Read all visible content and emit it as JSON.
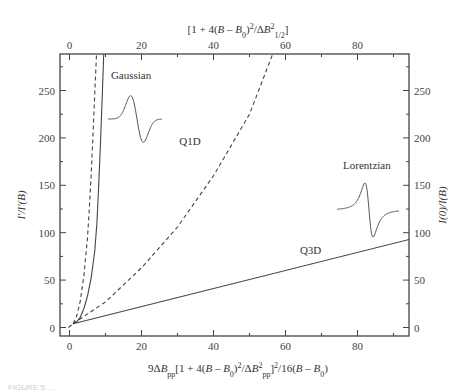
{
  "chart_data": {
    "type": "line",
    "title": "",
    "xlabel": "9ΔB_pp[1 + 4(B – B_0)^2/ΔB_pp^2]^2/16(B – B_0)",
    "x2label": "[1 + 4(B – B_0)^2/ΔB_1/2^2]",
    "ylabel": "I'/I'(B)",
    "y2label": "I(0)/I(B)",
    "xlim": [
      -0.3,
      94.5
    ],
    "ylim": [
      -7,
      288
    ],
    "x_ticks": [
      0,
      20,
      40,
      60,
      80
    ],
    "x_minor": [
      10,
      30,
      50,
      70,
      90
    ],
    "x2_ticks": [
      0,
      20,
      40,
      60,
      80
    ],
    "y_ticks": [
      0,
      50,
      100,
      150,
      200,
      250
    ],
    "y_minor": [
      25,
      75,
      125,
      175,
      225,
      275
    ],
    "grid": false,
    "series": [
      {
        "name": "Gaussian (solid)",
        "style": "solid",
        "x": [
          1,
          2,
          3,
          4,
          5,
          6,
          7,
          7.6,
          8.1,
          8.6,
          9.1,
          9.5
        ],
        "y": [
          4,
          6,
          11,
          20,
          33,
          52,
          80,
          110,
          150,
          195,
          245,
          288
        ]
      },
      {
        "name": "Gaussian (dashed)",
        "style": "dashed",
        "x": [
          1,
          2,
          3,
          4,
          5,
          5.5,
          6,
          6.5,
          7,
          7.5
        ],
        "y": [
          4,
          12,
          28,
          55,
          95,
          125,
          160,
          200,
          245,
          288
        ]
      },
      {
        "name": "Q1D",
        "style": "dashed",
        "x": [
          1,
          10,
          20,
          30,
          40,
          50,
          56.4
        ],
        "y": [
          4,
          27,
          63,
          106,
          160,
          225,
          288
        ]
      },
      {
        "name": "Q3D",
        "style": "solid",
        "x": [
          1,
          94.5
        ],
        "y": [
          4,
          93
        ]
      },
      {
        "name": "low-x dashed lead-in",
        "style": "dashed",
        "x": [
          -0.3,
          1
        ],
        "y": [
          0,
          4
        ]
      }
    ],
    "annotations": [
      {
        "text": "Gaussian",
        "x": 11.5,
        "y": 262
      },
      {
        "text": "Q1D",
        "x": 30.5,
        "y": 192
      },
      {
        "text": "Lorentzian",
        "x": 76,
        "y": 167
      },
      {
        "text": "Q3D",
        "x": 64,
        "y": 78
      }
    ],
    "insets": [
      {
        "name": "gaussian-derivative",
        "shape": "gaussian-first-derivative"
      },
      {
        "name": "lorentzian-derivative",
        "shape": "lorentzian-first-derivative"
      }
    ],
    "legend": "none"
  },
  "caption": "FIGURE 5.…"
}
